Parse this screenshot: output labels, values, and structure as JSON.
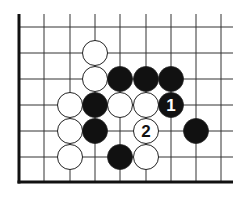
{
  "board": {
    "grid_x": [
      19,
      44,
      70,
      95,
      120,
      146,
      171,
      196,
      221
    ],
    "grid_y": [
      27,
      53,
      79,
      105,
      131,
      157,
      182
    ],
    "right_end": 233,
    "top_start": 14,
    "stone_radius": 12.5
  },
  "stones": [
    {
      "color": "white",
      "col": 3,
      "row": 1,
      "label": ""
    },
    {
      "color": "white",
      "col": 3,
      "row": 2,
      "label": ""
    },
    {
      "color": "white",
      "col": 2,
      "row": 3,
      "label": ""
    },
    {
      "color": "white",
      "col": 4,
      "row": 3,
      "label": ""
    },
    {
      "color": "white",
      "col": 5,
      "row": 3,
      "label": ""
    },
    {
      "color": "white",
      "col": 2,
      "row": 4,
      "label": ""
    },
    {
      "color": "white",
      "col": 5,
      "row": 4,
      "label": "2"
    },
    {
      "color": "white",
      "col": 2,
      "row": 5,
      "label": ""
    },
    {
      "color": "white",
      "col": 5,
      "row": 5,
      "label": ""
    },
    {
      "color": "black",
      "col": 4,
      "row": 2,
      "label": ""
    },
    {
      "color": "black",
      "col": 5,
      "row": 2,
      "label": ""
    },
    {
      "color": "black",
      "col": 6,
      "row": 2,
      "label": ""
    },
    {
      "color": "black",
      "col": 3,
      "row": 3,
      "label": ""
    },
    {
      "color": "black",
      "col": 6,
      "row": 3,
      "label": "1"
    },
    {
      "color": "black",
      "col": 3,
      "row": 4,
      "label": ""
    },
    {
      "color": "black",
      "col": 7,
      "row": 4,
      "label": ""
    },
    {
      "color": "black",
      "col": 4,
      "row": 5,
      "label": ""
    }
  ],
  "colors": {
    "line": "#333333",
    "edge": "#111111",
    "black_stone": "#111111",
    "white_stone": "#ffffff",
    "stone_outline": "#222222"
  }
}
